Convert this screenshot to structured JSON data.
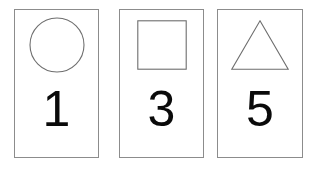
{
  "canvas": {
    "width": 316,
    "height": 169,
    "background_color": "#ffffff"
  },
  "style": {
    "card_border_color": "#8c8c8c",
    "card_fill_color": "#ffffff",
    "shape_stroke_color": "#6e6e6e",
    "digit_color": "#0a0a0a"
  },
  "cards": [
    {
      "id": "card-1",
      "shape_name": "circle",
      "shape_icon": "circle-outline-icon",
      "digit": "1"
    },
    {
      "id": "card-2",
      "shape_name": "square",
      "shape_icon": "square-outline-icon",
      "digit": "3"
    },
    {
      "id": "card-3",
      "shape_name": "triangle",
      "shape_icon": "triangle-outline-icon",
      "digit": "5"
    }
  ]
}
